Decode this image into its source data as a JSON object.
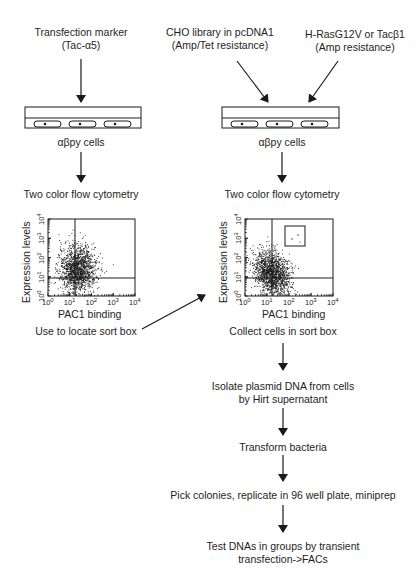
{
  "left_column": {
    "input_label_line1": "Transfection marker",
    "input_label_line2": "(Tac-α5)",
    "cells_label": "αβpy cells",
    "assay_label": "Two color flow cytometry",
    "plot": {
      "ylabel": "Expression levels",
      "xlabel": "PAC1 binding",
      "has_sort_box": false
    },
    "bottom_label": "Use to locate sort box"
  },
  "right_column": {
    "input_a_line1": "CHO library in pcDNA1",
    "input_a_line2": "(Amp/Tet resistance)",
    "input_b_line1": "H-RasG12V  or Tacβ1",
    "input_b_line2": "(Amp resistance)",
    "cells_label": "αβpy cells",
    "assay_label": "Two color flow cytometry",
    "plot": {
      "ylabel": "Expression levels",
      "xlabel": "PAC1 binding",
      "has_sort_box": true
    },
    "bottom_label": "Collect cells in sort box"
  },
  "steps": [
    {
      "line1": "Isolate plasmid DNA from cells",
      "line2": "by Hirt supernatant"
    },
    {
      "line1": "Transform bacteria",
      "line2": ""
    },
    {
      "line1": "Pick colonies, replicate in 96 well plate, miniprep",
      "line2": ""
    },
    {
      "line1": "Test DNAs in groups by transient",
      "line2": "transfection->FACs"
    }
  ],
  "axis_ticks": {
    "x": [
      "10",
      "10",
      "10",
      "10",
      "10"
    ],
    "x_exp": [
      "0",
      "1",
      "2",
      "3",
      "4"
    ],
    "y": [
      "10",
      "10",
      "10",
      "10",
      "10"
    ],
    "y_exp": [
      "0",
      "1",
      "2",
      "3",
      "4"
    ]
  },
  "colors": {
    "ink": "#1a1a1a",
    "background": "#ffffff"
  },
  "chart_data": [
    {
      "type": "scatter",
      "title": "",
      "xlabel": "PAC1 binding",
      "ylabel": "Expression levels",
      "xscale": "log",
      "yscale": "log",
      "xlim": [
        1,
        10000
      ],
      "ylim": [
        1,
        10000
      ],
      "x_ticks": [
        "10^0",
        "10^1",
        "10^2",
        "10^3",
        "10^4"
      ],
      "y_ticks": [
        "10^0",
        "10^1",
        "10^2",
        "10^3",
        "10^4"
      ],
      "quadrant_gates": {
        "x": 15,
        "y": 10
      },
      "population": {
        "center_x_log": 1.35,
        "center_y_log": 1.4,
        "spread": "broad, most events up to ~10^3 expression"
      },
      "sort_box": null
    },
    {
      "type": "scatter",
      "title": "",
      "xlabel": "PAC1 binding",
      "ylabel": "Expression levels",
      "xscale": "log",
      "yscale": "log",
      "xlim": [
        1,
        10000
      ],
      "ylim": [
        1,
        10000
      ],
      "x_ticks": [
        "10^0",
        "10^1",
        "10^2",
        "10^3",
        "10^4"
      ],
      "y_ticks": [
        "10^0",
        "10^1",
        "10^2",
        "10^3",
        "10^4"
      ],
      "quadrant_gates": {
        "x": 15,
        "y": 10
      },
      "population": {
        "center_x_log": 1.2,
        "center_y_log": 1.2,
        "spread": "main cluster below ~10^2.5 expression"
      },
      "sort_box": {
        "x_range": [
          80,
          1000
        ],
        "y_range": [
          250,
          3000
        ]
      }
    }
  ]
}
